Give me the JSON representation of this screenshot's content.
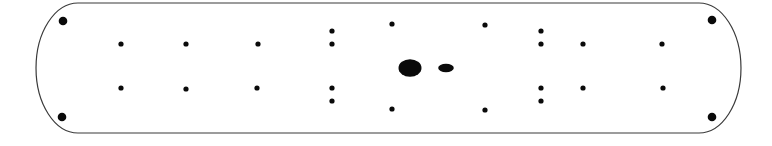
{
  "diagram": {
    "type": "panel-hole-layout",
    "colors": {
      "background": "#ffffff",
      "outline": "#3a3a3a",
      "hole": "#0a0a0a"
    },
    "outline": {
      "left": 36,
      "right": 741,
      "top": 3,
      "bottom": 133,
      "end_radius_x": 42,
      "end_radius_y": 65
    },
    "corner_holes": [
      {
        "cx": 63,
        "cy": 21,
        "r": 4.3
      },
      {
        "cx": 62,
        "cy": 117,
        "r": 4.3
      },
      {
        "cx": 712,
        "cy": 20,
        "r": 4.3
      },
      {
        "cx": 712,
        "cy": 117,
        "r": 4.3
      }
    ],
    "small_holes": [
      {
        "cx": 121,
        "cy": 44
      },
      {
        "cx": 186,
        "cy": 44
      },
      {
        "cx": 258,
        "cy": 44
      },
      {
        "cx": 332,
        "cy": 31
      },
      {
        "cx": 332,
        "cy": 44
      },
      {
        "cx": 392,
        "cy": 24
      },
      {
        "cx": 485,
        "cy": 25
      },
      {
        "cx": 541,
        "cy": 31
      },
      {
        "cx": 541,
        "cy": 44
      },
      {
        "cx": 583,
        "cy": 44
      },
      {
        "cx": 662,
        "cy": 44
      },
      {
        "cx": 121,
        "cy": 88
      },
      {
        "cx": 186,
        "cy": 89
      },
      {
        "cx": 257,
        "cy": 88
      },
      {
        "cx": 332,
        "cy": 88
      },
      {
        "cx": 332,
        "cy": 101
      },
      {
        "cx": 392,
        "cy": 109
      },
      {
        "cx": 485,
        "cy": 110
      },
      {
        "cx": 541,
        "cy": 88
      },
      {
        "cx": 541,
        "cy": 101
      },
      {
        "cx": 583,
        "cy": 88
      },
      {
        "cx": 663,
        "cy": 88
      }
    ],
    "small_hole_radius": 2.6,
    "center_features": [
      {
        "name": "large-oval",
        "cx": 410,
        "cy": 68,
        "rx": 11.5,
        "ry": 8.8
      },
      {
        "name": "small-oval",
        "cx": 446,
        "cy": 68,
        "rx": 7.8,
        "ry": 4.2
      }
    ]
  }
}
